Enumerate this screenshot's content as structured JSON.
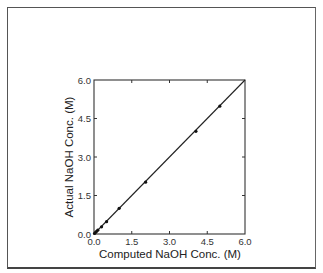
{
  "chart_data": {
    "type": "scatter",
    "title": "",
    "xlabel": "Computed NaOH Conc. (M)",
    "ylabel": "Actual  NaOH Conc. (M)",
    "xlim": [
      0,
      6
    ],
    "ylim": [
      0,
      6
    ],
    "xticks": [
      0,
      1.5,
      3,
      4.5,
      6
    ],
    "yticks": [
      0,
      1.5,
      3,
      4.5,
      6
    ],
    "xtick_labels": [
      "0.0",
      "1.5",
      "3.0",
      "4.5",
      "6.0"
    ],
    "ytick_labels": [
      "0.0",
      "1.5",
      "3.0",
      "4.5",
      "6.0"
    ],
    "grid": false,
    "legend": null,
    "series": [
      {
        "name": "measured",
        "marker": "filled-circle",
        "x": [
          0.02,
          0.05,
          0.1,
          0.15,
          0.3,
          0.5,
          1.0,
          2.05,
          4.05,
          5.0
        ],
        "y": [
          0.02,
          0.05,
          0.1,
          0.15,
          0.28,
          0.48,
          1.0,
          2.02,
          4.0,
          4.98
        ]
      }
    ],
    "reference_line": {
      "name": "y = x",
      "x": [
        0,
        6
      ],
      "y": [
        0,
        6
      ]
    }
  }
}
